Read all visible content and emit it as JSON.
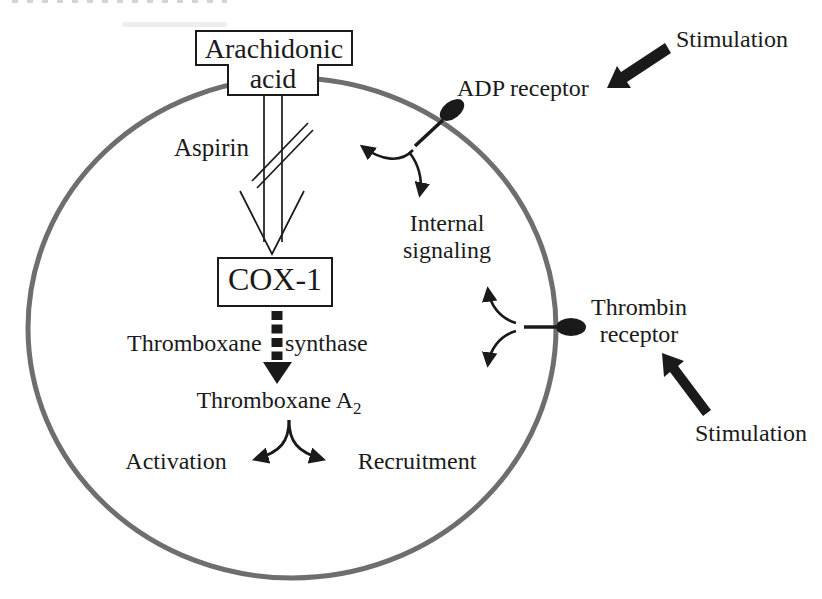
{
  "colors": {
    "background": "#ffffff",
    "ink": "#1a1a1a",
    "membrane": "#6e6e6e"
  },
  "cell": {
    "arachidonic_box": {
      "line1": "Arachidonic",
      "line2": "acid"
    },
    "aspirin_label": "Aspirin",
    "cox1_box": "COX-1",
    "synthase_label_left": "Thromboxane",
    "synthase_label_right": "synthase",
    "thromboxane_a2": {
      "base": "Thromboxane A",
      "subscript": "2"
    },
    "activation_label": "Activation",
    "recruitment_label": "Recruitment",
    "internal_signaling": {
      "line1": "Internal",
      "line2": "signaling"
    }
  },
  "receptors": {
    "adp": {
      "label": "ADP receptor"
    },
    "thrombin": {
      "label_line1": "Thrombin",
      "label_line2": "receptor"
    }
  },
  "stimulation": {
    "top_label": "Stimulation",
    "bottom_label": "Stimulation"
  }
}
